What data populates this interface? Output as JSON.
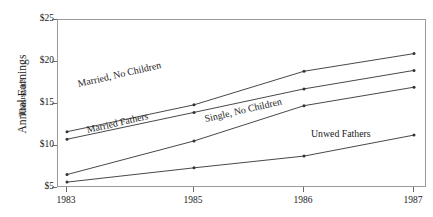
{
  "chart_data": {
    "type": "line",
    "title": "",
    "xlabel": "",
    "ylabel": "Annual Earnings",
    "ylabel_sub": "Thousands",
    "x": [
      1983,
      1985,
      1986,
      1987
    ],
    "xtick_labels": [
      "1983",
      "1985",
      "1986",
      "1987"
    ],
    "ytick_labels": [
      "$25",
      "$20",
      "$15",
      "$10",
      "$5"
    ],
    "ytick_values": [
      25,
      20,
      15,
      10,
      5
    ],
    "ylim": [
      5,
      25
    ],
    "grid": false,
    "legend_position": "inline-annotations",
    "marker": "dot",
    "line_color": "#333333",
    "series": [
      {
        "name": "Married, No Children",
        "values": [
          11.7,
          14.9,
          18.9,
          21.0
        ]
      },
      {
        "name": "Married Fathers",
        "values": [
          10.8,
          14.0,
          16.8,
          19.0
        ]
      },
      {
        "name": "Single, No Children",
        "values": [
          6.6,
          10.6,
          14.8,
          17.0
        ]
      },
      {
        "name": "Unwed Fathers",
        "values": [
          5.7,
          7.4,
          8.8,
          11.3
        ]
      }
    ],
    "annotations": [
      {
        "text": "Married, No Children",
        "rotation": -13
      },
      {
        "text": "Married Fathers",
        "rotation": -13
      },
      {
        "text": "Single, No Children",
        "rotation": -13
      },
      {
        "text": "Unwed Fathers",
        "rotation": 0
      }
    ]
  }
}
